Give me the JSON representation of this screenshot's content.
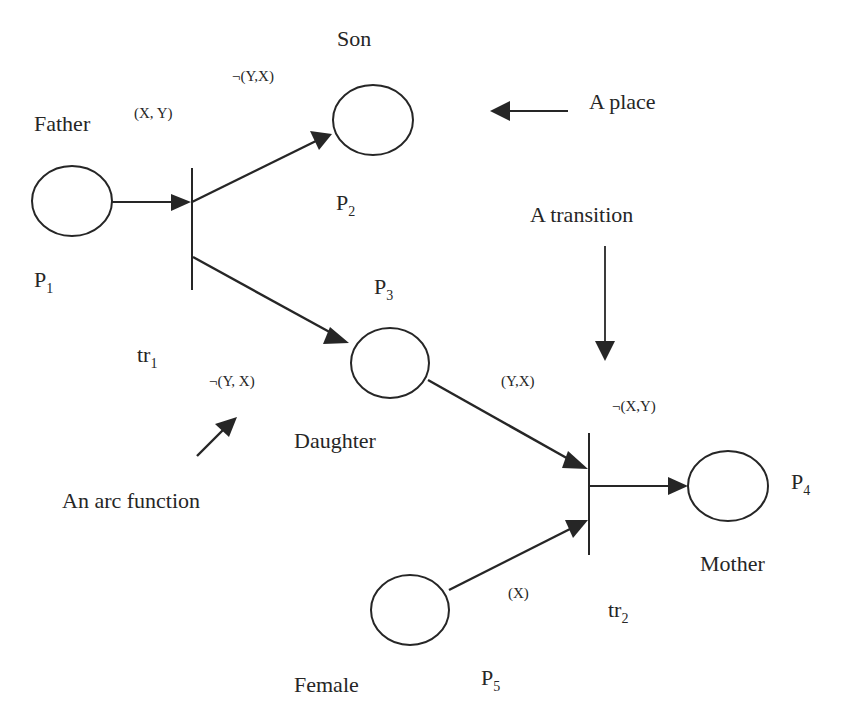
{
  "places": [
    {
      "id": "P1",
      "label": "P",
      "sub": "1",
      "name": "Father"
    },
    {
      "id": "P2",
      "label": "P",
      "sub": "2",
      "name": "Son"
    },
    {
      "id": "P3",
      "label": "P",
      "sub": "3",
      "name": "Daughter"
    },
    {
      "id": "P4",
      "label": "P",
      "sub": "4",
      "name": "Mother"
    },
    {
      "id": "P5",
      "label": "P",
      "sub": "5",
      "name": "Female"
    }
  ],
  "transitions": [
    {
      "id": "tr1",
      "label": "tr",
      "sub": "1"
    },
    {
      "id": "tr2",
      "label": "tr",
      "sub": "2"
    }
  ],
  "arc_functions": {
    "p1_tr1": "(X, Y)",
    "tr1_p2": "¬(Y,X)",
    "tr1_p3": "¬(Y, X)",
    "p3_tr2": "(Y,X)",
    "tr2_p4": "¬(X,Y)",
    "p5_tr2": "(X)"
  },
  "annotations": {
    "place": "A place",
    "transition": "A transition",
    "arc_function": "An arc function"
  },
  "colors": {
    "ink": "#262626",
    "background": "#ffffff"
  }
}
